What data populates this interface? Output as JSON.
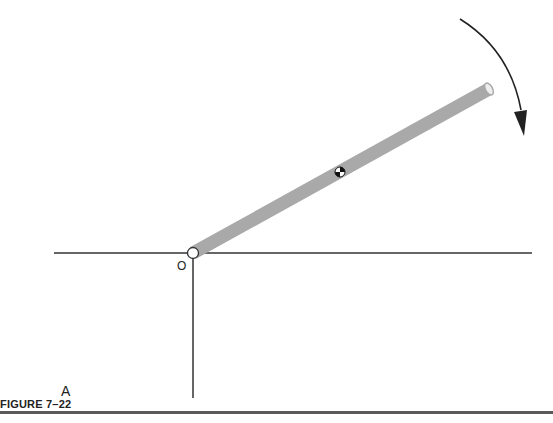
{
  "figure": {
    "caption": "FIGURE 7–22",
    "panel_label": "A",
    "pivot_label": "O",
    "rod_color": "#a9a9a9",
    "line_color": "#333333",
    "arrow_direction": "clockwise",
    "elements": [
      "horizontal-reference-line",
      "vertical-reference-line",
      "rod",
      "pivot-point",
      "center-of-mass-marker",
      "rotation-arrow"
    ]
  }
}
